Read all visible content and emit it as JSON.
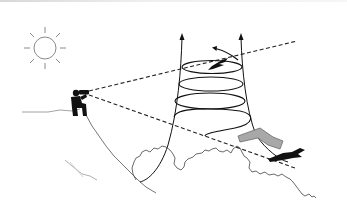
{
  "figure": {
    "type": "illustration",
    "elements": [
      {
        "id": "sun",
        "icon": "sun-icon"
      },
      {
        "id": "observer",
        "icon": "person-with-binoculars-icon"
      },
      {
        "id": "hill",
        "icon": "hill-outline"
      },
      {
        "id": "sight-line-upper",
        "style": "dashed"
      },
      {
        "id": "sight-line-lower",
        "style": "dashed"
      },
      {
        "id": "thermal-spiral",
        "turns": 4
      },
      {
        "id": "thermal-updraft-arrows",
        "count": 2
      },
      {
        "id": "bird-circling",
        "icon": "bird-icon"
      },
      {
        "id": "bird-gliding",
        "icon": "bird-icon"
      },
      {
        "id": "approach-arrow",
        "color": "#a8a8a8"
      },
      {
        "id": "tree-canopy",
        "icon": "tree-canopy-outline"
      }
    ],
    "colors": {
      "ink": "#111111",
      "sun": "#888888",
      "hill": "#777777",
      "arrow_fill": "#a8a8a8",
      "arrow_stroke": "#666666",
      "canopy": "#444444"
    }
  }
}
